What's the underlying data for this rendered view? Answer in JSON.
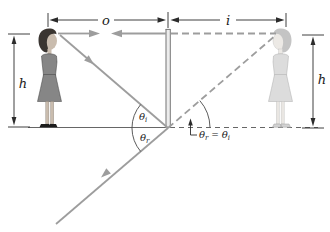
{
  "diagram": {
    "labels": {
      "object_distance": "o",
      "image_distance": "i",
      "object_height": "h",
      "image_height": "h",
      "theta": "θ",
      "sub_incidence": "i",
      "sub_reflection": "r",
      "equals": " = "
    },
    "colors": {
      "background": "#ffffff",
      "ray": "#9d9d9d",
      "dimension": "#2b2b2b",
      "ground": "#555555",
      "mirror_edge": "#777777",
      "mirror_fill": "#ececec",
      "object_dress": "#868686",
      "object_hair": "#3a3531",
      "skin": "#c9bcae",
      "image_figure": "#dcdcdc",
      "image_outline": "#adadad",
      "shoe": "#1c1c1c"
    }
  }
}
